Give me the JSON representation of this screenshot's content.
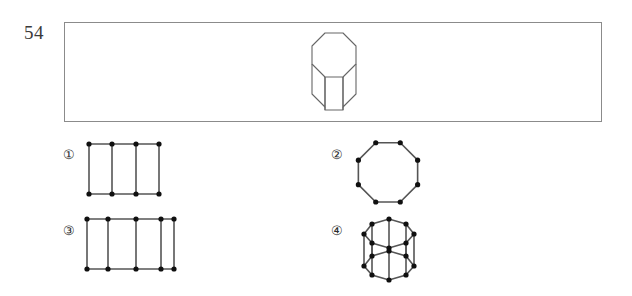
{
  "question": {
    "number": "54",
    "stem_figure": {
      "name": "octagonal-prism-solid",
      "description": "octagonal prism drawn in perspective, top octagonal face visible, three vertical side edges visible"
    }
  },
  "options": [
    {
      "label": "①",
      "marker_text": "1",
      "figure_name": "ladder-graph-4-columns",
      "description": "ladder graph: 4 vertices on top row, 4 vertices on bottom row, vertical rungs and horizontal rails",
      "vertex_count": 8,
      "columns": 4
    },
    {
      "label": "②",
      "marker_text": "2",
      "figure_name": "octagon-cycle-graph",
      "description": "single cycle graph with 8 vertices arranged as a regular octagon",
      "vertex_count": 8,
      "columns": 0
    },
    {
      "label": "③",
      "marker_text": "3",
      "figure_name": "ladder-graph-5-columns",
      "description": "ladder graph: 5 vertices on top row, 5 vertices on bottom row, vertical rungs and horizontal rails",
      "vertex_count": 10,
      "columns": 5
    },
    {
      "label": "④",
      "marker_text": "4",
      "figure_name": "octagonal-prism-graph-3d",
      "description": "octagonal prism graph drawn in 3D: two octagon cycles joined by 8 vertical edges",
      "vertex_count": 16,
      "columns": 8
    }
  ],
  "colors": {
    "ink": "#1a1a1a",
    "edge": "#555555",
    "node": "#101010",
    "panel_border": "#8b8b8b",
    "background": "#ffffff"
  }
}
